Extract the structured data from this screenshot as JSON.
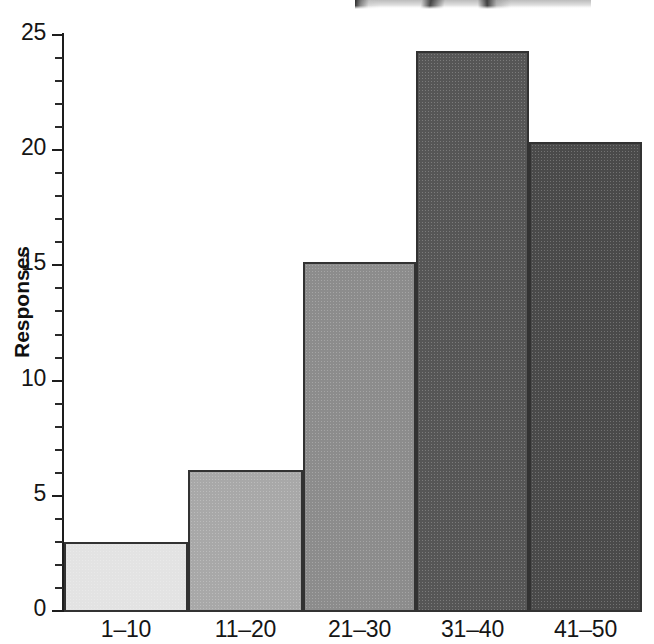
{
  "chart_data": {
    "type": "bar",
    "title": "",
    "subtitle": "",
    "xlabel": "",
    "ylabel": "Responses",
    "categories": [
      "1–10",
      "11–20",
      "21–30",
      "31–40",
      "41–50"
    ],
    "values": [
      3.0,
      6.1,
      15.1,
      24.2,
      20.3
    ],
    "series": [
      {
        "name": "Responses",
        "values": [
          3.0,
          6.1,
          15.1,
          24.2,
          20.3
        ]
      }
    ],
    "ylim": [
      0,
      25
    ],
    "xlim": [
      0,
      5
    ],
    "y_major_ticks": [
      0,
      5,
      10,
      15,
      20,
      25
    ],
    "y_tick_labels": [
      "0",
      "5",
      "10",
      "15",
      "20",
      "25"
    ],
    "y_minor_tick_step": 1,
    "grid": false,
    "legend": null,
    "legend_position": "none",
    "bar_gap": 0,
    "bar_colors": [
      "#e3e3e3",
      "#a8a8a8",
      "#8c8c8c",
      "#565656",
      "#4a4a4a"
    ],
    "bar_edge_color": "#323232",
    "axis_color": "#1d1d1d",
    "background_color": "#ffffff",
    "annotations": []
  },
  "axis": {
    "y_title": "Responses",
    "y_ticks": [
      {
        "label": "25",
        "value": 25
      },
      {
        "label": "20",
        "value": 20
      },
      {
        "label": "15",
        "value": 15
      },
      {
        "label": "10",
        "value": 10
      },
      {
        "label": "5",
        "value": 5
      },
      {
        "label": "0",
        "value": 0
      }
    ]
  },
  "bars": [
    {
      "category": "1–10",
      "value": 3.0,
      "color": "#e3e3e3"
    },
    {
      "category": "11–20",
      "value": 6.1,
      "color": "#a8a8a8"
    },
    {
      "category": "21–30",
      "value": 15.1,
      "color": "#8c8c8c"
    },
    {
      "category": "31–40",
      "value": 24.2,
      "color": "#565656"
    },
    {
      "category": "41–50",
      "value": 20.3,
      "color": "#4a4a4a"
    }
  ],
  "artifacts": {
    "photo_sliver": "scanned-photo-edge"
  }
}
